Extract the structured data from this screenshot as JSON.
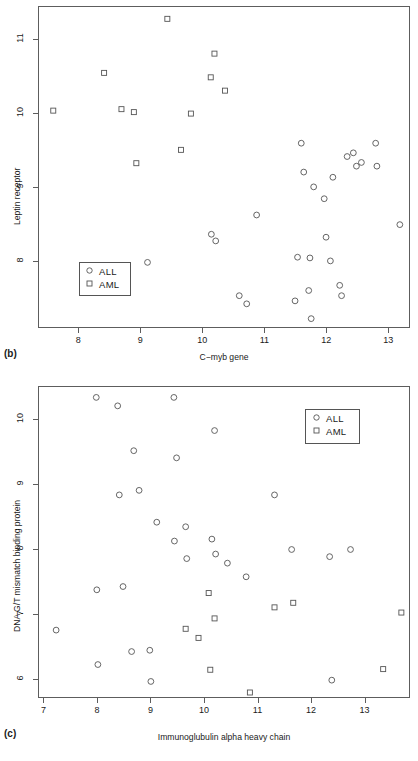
{
  "figure": {
    "background": "#ffffff",
    "marker_color": "#555555",
    "axis_color": "#5d5d5d"
  },
  "panels": [
    {
      "id": "b",
      "label": "(b)",
      "legend": {
        "items": [
          {
            "glyph": "circle",
            "label": "ALL"
          },
          {
            "glyph": "square",
            "label": "AML"
          }
        ]
      },
      "chart_data": {
        "type": "scatter",
        "title": "",
        "xlabel": "C−myb gene",
        "ylabel": "Leptin receptor",
        "xlim": [
          7.35,
          13.35
        ],
        "ylim": [
          7.1,
          11.45
        ],
        "xticks": [
          8,
          9,
          10,
          11,
          12,
          13
        ],
        "yticks": [
          8,
          9,
          10,
          11
        ],
        "grid": false,
        "legend_position": "bottom-left",
        "series": [
          {
            "name": "ALL",
            "marker": "circle",
            "points": [
              [
                9.1,
                8.0
              ],
              [
                10.13,
                8.38
              ],
              [
                10.2,
                8.29
              ],
              [
                10.58,
                7.55
              ],
              [
                10.7,
                7.44
              ],
              [
                10.86,
                8.64
              ],
              [
                11.48,
                7.48
              ],
              [
                11.52,
                8.07
              ],
              [
                11.58,
                9.61
              ],
              [
                11.62,
                9.22
              ],
              [
                11.7,
                7.62
              ],
              [
                11.72,
                8.06
              ],
              [
                11.74,
                7.24
              ],
              [
                11.78,
                9.02
              ],
              [
                11.95,
                8.86
              ],
              [
                11.98,
                8.34
              ],
              [
                12.05,
                8.02
              ],
              [
                12.09,
                9.15
              ],
              [
                12.2,
                7.69
              ],
              [
                12.23,
                7.55
              ],
              [
                12.32,
                9.43
              ],
              [
                12.42,
                9.48
              ],
              [
                12.47,
                9.3
              ],
              [
                12.55,
                9.35
              ],
              [
                12.78,
                9.61
              ],
              [
                12.8,
                9.3
              ],
              [
                13.17,
                8.51
              ]
            ]
          },
          {
            "name": "AML",
            "marker": "square",
            "points": [
              [
                7.58,
                10.05
              ],
              [
                8.4,
                10.56
              ],
              [
                8.68,
                10.07
              ],
              [
                8.88,
                10.03
              ],
              [
                8.92,
                9.34
              ],
              [
                9.42,
                11.29
              ],
              [
                9.64,
                9.52
              ],
              [
                9.8,
                10.01
              ],
              [
                10.12,
                10.5
              ],
              [
                10.18,
                10.82
              ],
              [
                10.35,
                10.32
              ]
            ]
          }
        ]
      }
    },
    {
      "id": "c",
      "label": "(c)",
      "legend": {
        "items": [
          {
            "glyph": "circle",
            "label": "ALL"
          },
          {
            "glyph": "square",
            "label": "AML"
          }
        ]
      },
      "chart_data": {
        "type": "scatter",
        "title": "",
        "xlabel": "Immunoglubulin alpha heavy chain",
        "ylabel": "DNA G/T mismatch binding protein",
        "xlim": [
          6.9,
          13.85
        ],
        "ylim": [
          5.7,
          10.5
        ],
        "xticks": [
          7,
          8,
          9,
          10,
          11,
          12,
          13
        ],
        "yticks": [
          6,
          7,
          8,
          9,
          10
        ],
        "grid": false,
        "legend_position": "top-right",
        "series": [
          {
            "name": "ALL",
            "marker": "circle",
            "points": [
              [
                7.22,
                6.76
              ],
              [
                7.97,
                10.34
              ],
              [
                7.98,
                7.38
              ],
              [
                8.0,
                6.23
              ],
              [
                8.37,
                10.21
              ],
              [
                8.4,
                8.84
              ],
              [
                8.47,
                7.43
              ],
              [
                8.63,
                6.43
              ],
              [
                8.67,
                9.52
              ],
              [
                8.77,
                8.91
              ],
              [
                8.97,
                6.45
              ],
              [
                8.99,
                5.97
              ],
              [
                9.1,
                8.42
              ],
              [
                9.42,
                10.34
              ],
              [
                9.43,
                8.13
              ],
              [
                9.47,
                9.41
              ],
              [
                9.64,
                8.35
              ],
              [
                9.66,
                7.86
              ],
              [
                10.13,
                8.16
              ],
              [
                10.18,
                9.83
              ],
              [
                10.2,
                7.93
              ],
              [
                10.42,
                7.79
              ],
              [
                10.77,
                7.58
              ],
              [
                11.3,
                8.84
              ],
              [
                11.62,
                8.0
              ],
              [
                12.33,
                7.89
              ],
              [
                12.37,
                5.99
              ],
              [
                12.72,
                8.0
              ]
            ]
          },
          {
            "name": "AML",
            "marker": "square",
            "points": [
              [
                9.64,
                6.78
              ],
              [
                9.88,
                6.64
              ],
              [
                10.07,
                7.33
              ],
              [
                10.1,
                6.15
              ],
              [
                10.18,
                6.94
              ],
              [
                10.84,
                5.8
              ],
              [
                11.3,
                7.11
              ],
              [
                11.65,
                7.18
              ],
              [
                13.33,
                6.16
              ],
              [
                13.67,
                7.03
              ]
            ]
          }
        ]
      }
    }
  ]
}
